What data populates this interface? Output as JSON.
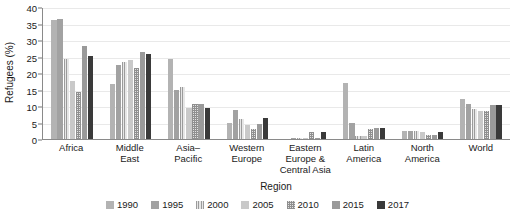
{
  "chart_data": {
    "type": "bar",
    "title": "",
    "xlabel": "Region",
    "ylabel": "Refugees (%)",
    "ylim": [
      0,
      40
    ],
    "yticks": [
      0,
      5,
      10,
      15,
      20,
      25,
      30,
      35,
      40
    ],
    "grid": true,
    "legend_position": "bottom",
    "categories": [
      "Africa",
      "Middle East",
      "Asia–Pacific",
      "Western Europe",
      "Eastern Europe & Central Asia",
      "Latin America",
      "North America",
      "World"
    ],
    "category_lines": [
      [
        "Africa"
      ],
      [
        "Middle",
        "East"
      ],
      [
        "Asia–",
        "Pacific"
      ],
      [
        "Western",
        "Europe"
      ],
      [
        "Eastern",
        "Europe &",
        "Central Asia"
      ],
      [
        "Latin",
        "America"
      ],
      [
        "North",
        "America"
      ],
      [
        "World"
      ]
    ],
    "series": [
      {
        "name": "1990",
        "color": "#b3b3b3",
        "pattern": "solid",
        "values": [
          36.1,
          16.8,
          24.2,
          4.8,
          0.0,
          16.9,
          2.4,
          12.0
        ]
      },
      {
        "name": "1995",
        "color": "#a2a2a2",
        "pattern": "solid-dark",
        "values": [
          36.3,
          22.4,
          14.8,
          8.7,
          0.2,
          4.9,
          2.3,
          10.6
        ]
      },
      {
        "name": "2000",
        "color": "#9b9b9b",
        "pattern": "v-stripes",
        "values": [
          24.3,
          23.2,
          15.7,
          6.2,
          0.3,
          0.8,
          2.3,
          9.1
        ]
      },
      {
        "name": "2005",
        "color": "#c9c9c9",
        "pattern": "light-solid",
        "values": [
          17.7,
          23.8,
          9.3,
          4.1,
          0.2,
          1.0,
          2.1,
          8.5
        ]
      },
      {
        "name": "2010",
        "color": "#8f8f8f",
        "pattern": "checker",
        "values": [
          14.3,
          21.4,
          10.6,
          2.9,
          2.2,
          3.0,
          1.2,
          8.5
        ]
      },
      {
        "name": "2015",
        "color": "#9a9a9a",
        "pattern": "solid-mid",
        "values": [
          28.3,
          26.4,
          10.6,
          4.6,
          0.3,
          3.2,
          1.1,
          10.2
        ]
      },
      {
        "name": "2017",
        "color": "#3a3a3a",
        "pattern": "solid-black",
        "values": [
          25.3,
          25.8,
          9.4,
          6.4,
          2.1,
          3.3,
          2.2,
          10.2
        ]
      }
    ]
  }
}
